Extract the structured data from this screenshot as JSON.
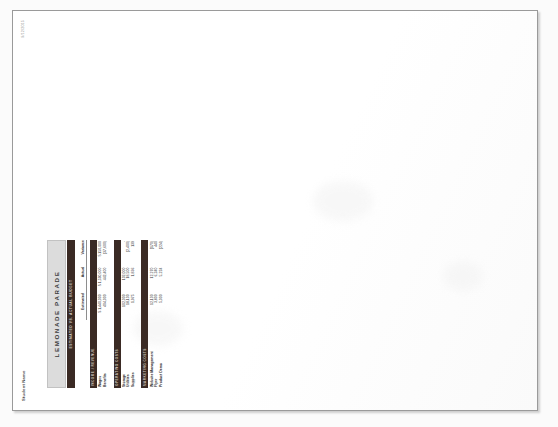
{
  "page": {
    "date_stamp": "9/12/2015",
    "student_name": "Student Name"
  },
  "worksheet": {
    "title": "LEMONADE PARADE",
    "subtitle": "ESTIMATED VS. ACTUAL BUDGET",
    "columns": {
      "label": "",
      "estimated": "Estimated",
      "actual": "Actual",
      "variance": "Variance"
    },
    "sections": [
      {
        "name": "section-income",
        "heading": "INCOME / REVENUE",
        "rows": [
          {
            "label": "Wages",
            "estimated": "$ 1,440,000",
            "actual": "$ 1,590,000",
            "variance": "$ 150,000"
          },
          {
            "label": "Benefits",
            "estimated": "404,000",
            "actual": "442,400",
            "variance": "(37,600)"
          }
        ]
      },
      {
        "name": "section-operating",
        "heading": "OPERATING COSTS",
        "rows": [
          {
            "label": "Storage",
            "estimated": "102,000",
            "actual": "102,000",
            "variance": "-"
          },
          {
            "label": "Utilities",
            "estimated": "18,100",
            "actual": "18,500",
            "variance": "(2,400)"
          },
          {
            "label": "Supplies",
            "estimated": "1,975",
            "actual": "1,836",
            "variance": "139"
          }
        ]
      },
      {
        "name": "section-marketing",
        "heading": "MARKETING COSTS",
        "rows": [
          {
            "label": "Website Management",
            "estimated": "12,100",
            "actual": "12,270",
            "variance": "(170)"
          },
          {
            "label": "Flyer",
            "estimated": "3,800",
            "actual": "6,240",
            "variance": "440"
          },
          {
            "label": "Product Demo",
            "estimated": "5,000",
            "actual": "5,224",
            "variance": "(224)"
          }
        ]
      }
    ]
  },
  "colors": {
    "band_dark": "#3a2a24",
    "title_gray": "#dcdcdc",
    "page_border": "#9a9a9a",
    "text": "#2c2c2c"
  }
}
